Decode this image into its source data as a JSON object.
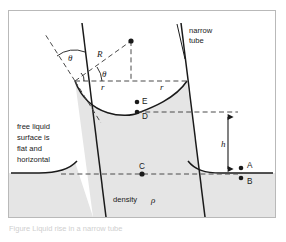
{
  "figure": {
    "title_semantic": "capillary-rise-in-narrow-tube",
    "frame": {
      "border_color": "#b9b9b9",
      "background": "#ffffff"
    },
    "colors": {
      "liquid_fill": "#e5e5e5",
      "line": "#1a1a1a",
      "dashed": "#4a4a4a",
      "frame_border": "#b9b9b9",
      "caption_faint": "#cfcfcf"
    },
    "labels": {
      "narrow_tube": "narrow\ntube",
      "narrow_tube_line1": "narrow",
      "narrow_tube_line2": "tube",
      "free_surface_line1": "free liquid",
      "free_surface_line2": "surface is",
      "free_surface_line3": "flat and",
      "free_surface_line4": "horizontal",
      "density_word": "density",
      "density_symbol": "ρ",
      "theta_outer": "θ",
      "theta_inner": "θ",
      "radius_R": "R",
      "radius_r_left": "r",
      "radius_r_right": "r",
      "height_h": "h"
    },
    "points": [
      {
        "id": "A",
        "label": "A",
        "x": 232,
        "y": 160,
        "label_dx": 6,
        "label_dy": -2
      },
      {
        "id": "B",
        "label": "B",
        "x": 232,
        "y": 169,
        "label_dx": 6,
        "label_dy": 7
      },
      {
        "id": "C",
        "label": "C",
        "x": 133,
        "y": 163,
        "label_dx": -1,
        "label_dy": -5
      },
      {
        "id": "D",
        "label": "D",
        "x": 129,
        "y": 101,
        "label_dx": 5,
        "label_dy": 7
      },
      {
        "id": "E",
        "label": "E",
        "x": 129,
        "y": 91,
        "label_dx": 5,
        "label_dy": 2
      }
    ],
    "caption_faint": "Figure  Liquid rise in a narrow tube"
  }
}
